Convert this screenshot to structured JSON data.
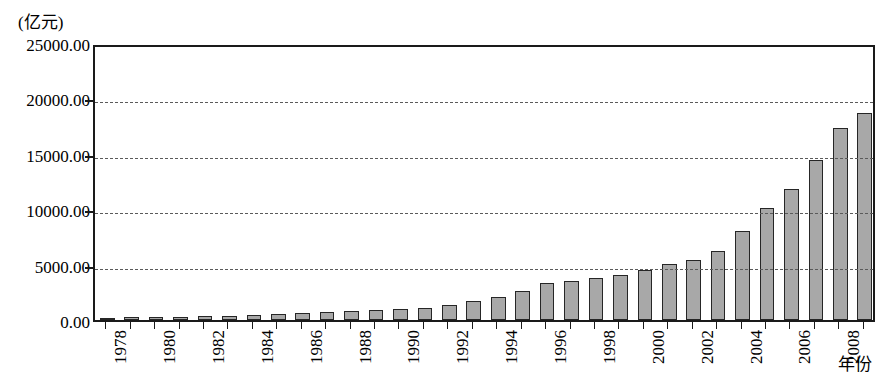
{
  "chart_data": {
    "type": "bar",
    "title": "",
    "subtitle": "",
    "unit_label": "(亿元)",
    "ylabel": "(亿元)",
    "xlabel": "年份",
    "ylim": [
      0,
      25000
    ],
    "ytick_labels": [
      "25000.00",
      "20000.00",
      "15000.00",
      "10000.00",
      "5000.00",
      "0.00"
    ],
    "ytick_values": [
      25000,
      20000,
      15000,
      10000,
      5000,
      0
    ],
    "grid": true,
    "grid_axis": "y",
    "grid_style": "dashed",
    "legend": "none",
    "bar_fill_color": "#a8a8a8",
    "bar_edge_color": "#262626",
    "categories": [
      "1978",
      "1979",
      "1980",
      "1981",
      "1982",
      "1983",
      "1984",
      "1985",
      "1986",
      "1987",
      "1988",
      "1989",
      "1990",
      "1991",
      "1992",
      "1993",
      "1994",
      "1995",
      "1996",
      "1997",
      "1998",
      "1999",
      "2000",
      "2001",
      "2002",
      "2003",
      "2004",
      "2005",
      "2006",
      "2007",
      "2008",
      "2009"
    ],
    "visible_tick_labels": [
      "1978",
      "1980",
      "1982",
      "1984",
      "1986",
      "1988",
      "1990",
      "1992",
      "1994",
      "1996",
      "1998",
      "2000",
      "2002",
      "2004",
      "2006",
      "2008"
    ],
    "values": [
      210,
      230,
      270,
      280,
      320,
      370,
      450,
      520,
      610,
      680,
      790,
      880,
      970,
      1100,
      1350,
      1700,
      2100,
      2650,
      3300,
      3550,
      3800,
      4100,
      4550,
      5100,
      5450,
      6250,
      8000,
      10100,
      11800,
      14400,
      17300,
      18700
    ],
    "series": [
      {
        "name": "",
        "values": [
          210,
          230,
          270,
          280,
          320,
          370,
          450,
          520,
          610,
          680,
          790,
          880,
          970,
          1100,
          1350,
          1700,
          2100,
          2650,
          3300,
          3550,
          3800,
          4100,
          4550,
          5100,
          5450,
          6250,
          8000,
          10100,
          11800,
          14400,
          17300,
          18700
        ]
      }
    ]
  }
}
